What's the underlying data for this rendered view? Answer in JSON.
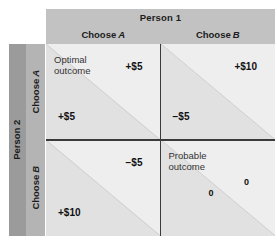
{
  "figure": {
    "column_header": {
      "label": "Person 1",
      "options": [
        {
          "prefix": "Choose",
          "choice": "A"
        },
        {
          "prefix": "Choose",
          "choice": "B"
        }
      ]
    },
    "row_header": {
      "label": "Person 2",
      "options": [
        {
          "prefix": "Choose",
          "choice": "A"
        },
        {
          "prefix": "Choose",
          "choice": "B"
        }
      ]
    },
    "colors": {
      "header_band": "#c2c2c2",
      "row_label_band": "#9b9b9b",
      "row_option_band": "#b4b4b4",
      "cell_upper": "#eeeeee",
      "cell_lower": "#e1e1e1",
      "divider": "#3a3a3a",
      "diagonal": "#c9c9c9",
      "text": "#111111"
    },
    "cells": [
      {
        "id": "cell-a-a",
        "row": "Choose A",
        "column": "Choose A",
        "annotation": "Optimal\noutcome",
        "person1_payoff": "+$5",
        "person2_payoff": "+$5"
      },
      {
        "id": "cell-a-b",
        "row": "Choose A",
        "column": "Choose B",
        "annotation": "",
        "person1_payoff": "+$10",
        "person2_payoff": "−$5"
      },
      {
        "id": "cell-b-a",
        "row": "Choose B",
        "column": "Choose A",
        "annotation": "",
        "person1_payoff": "−$5",
        "person2_payoff": "+$10"
      },
      {
        "id": "cell-b-b",
        "row": "Choose B",
        "column": "Choose B",
        "annotation": "Probable\noutcome",
        "person1_payoff": "0",
        "person2_payoff": "0"
      }
    ]
  }
}
